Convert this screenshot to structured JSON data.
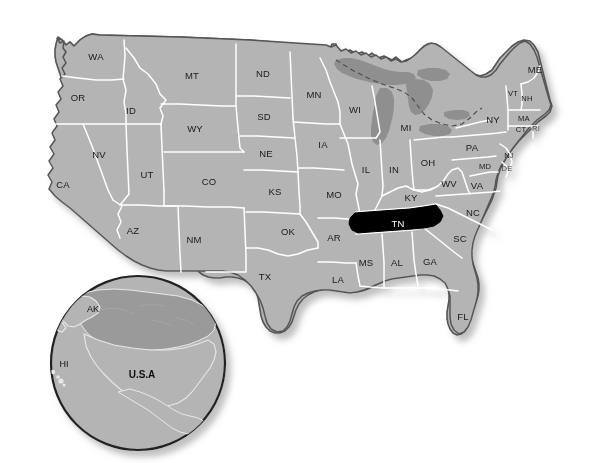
{
  "map": {
    "title": "United States map with Tennessee highlighted",
    "highlighted_state": "TN",
    "colors": {
      "state_fill": "#b4b4b4",
      "highlight_fill": "#000000",
      "highlight_label": "#ffffff",
      "state_border": "#ffffff",
      "outer_border": "#555555",
      "lake_fill": "#8f8f8f",
      "label": "#1a1a1a",
      "background": "#ffffff",
      "shadow": "#cfcfcf",
      "inset_land": "#b4b4b4",
      "inset_canada": "#9a9a9a",
      "inset_ring": "#222222"
    },
    "states": [
      {
        "code": "WA",
        "x": 96,
        "y": 57,
        "size": "normal"
      },
      {
        "code": "OR",
        "x": 78,
        "y": 98,
        "size": "normal"
      },
      {
        "code": "CA",
        "x": 63,
        "y": 185,
        "size": "normal"
      },
      {
        "code": "ID",
        "x": 131,
        "y": 111,
        "size": "normal"
      },
      {
        "code": "NV",
        "x": 99,
        "y": 155,
        "size": "normal"
      },
      {
        "code": "UT",
        "x": 147,
        "y": 175,
        "size": "normal"
      },
      {
        "code": "AZ",
        "x": 133,
        "y": 231,
        "size": "normal"
      },
      {
        "code": "MT",
        "x": 192,
        "y": 76,
        "size": "normal"
      },
      {
        "code": "WY",
        "x": 195,
        "y": 129,
        "size": "normal"
      },
      {
        "code": "CO",
        "x": 209,
        "y": 182,
        "size": "normal"
      },
      {
        "code": "NM",
        "x": 194,
        "y": 240,
        "size": "normal"
      },
      {
        "code": "ND",
        "x": 263,
        "y": 74,
        "size": "normal"
      },
      {
        "code": "SD",
        "x": 264,
        "y": 117,
        "size": "normal"
      },
      {
        "code": "NE",
        "x": 266,
        "y": 154,
        "size": "normal"
      },
      {
        "code": "KS",
        "x": 275,
        "y": 192,
        "size": "normal"
      },
      {
        "code": "OK",
        "x": 288,
        "y": 232,
        "size": "normal"
      },
      {
        "code": "TX",
        "x": 265,
        "y": 277,
        "size": "normal"
      },
      {
        "code": "MN",
        "x": 314,
        "y": 95,
        "size": "normal"
      },
      {
        "code": "IA",
        "x": 323,
        "y": 145,
        "size": "normal"
      },
      {
        "code": "MO",
        "x": 334,
        "y": 195,
        "size": "normal"
      },
      {
        "code": "AR",
        "x": 334,
        "y": 238,
        "size": "normal"
      },
      {
        "code": "LA",
        "x": 338,
        "y": 280,
        "size": "normal"
      },
      {
        "code": "WI",
        "x": 355,
        "y": 110,
        "size": "normal"
      },
      {
        "code": "IL",
        "x": 366,
        "y": 170,
        "size": "normal"
      },
      {
        "code": "MS",
        "x": 366,
        "y": 263,
        "size": "normal"
      },
      {
        "code": "MI",
        "x": 406,
        "y": 128,
        "size": "normal"
      },
      {
        "code": "IN",
        "x": 394,
        "y": 170,
        "size": "normal"
      },
      {
        "code": "KY",
        "x": 411,
        "y": 198,
        "size": "normal"
      },
      {
        "code": "TN",
        "x": 398,
        "y": 224,
        "size": "normal"
      },
      {
        "code": "AL",
        "x": 397,
        "y": 263,
        "size": "normal"
      },
      {
        "code": "OH",
        "x": 428,
        "y": 163,
        "size": "normal"
      },
      {
        "code": "WV",
        "x": 449,
        "y": 184,
        "size": "normal"
      },
      {
        "code": "GA",
        "x": 430,
        "y": 262,
        "size": "normal"
      },
      {
        "code": "FL",
        "x": 463,
        "y": 317,
        "size": "normal"
      },
      {
        "code": "SC",
        "x": 460,
        "y": 239,
        "size": "normal"
      },
      {
        "code": "NC",
        "x": 473,
        "y": 213,
        "size": "normal"
      },
      {
        "code": "VA",
        "x": 477,
        "y": 186,
        "size": "normal"
      },
      {
        "code": "PA",
        "x": 472,
        "y": 148,
        "size": "normal"
      },
      {
        "code": "NY",
        "x": 493,
        "y": 120,
        "size": "normal"
      },
      {
        "code": "ME",
        "x": 535,
        "y": 70,
        "size": "normal"
      },
      {
        "code": "VT",
        "x": 513,
        "y": 94,
        "size": "tiny"
      },
      {
        "code": "NH",
        "x": 527,
        "y": 99,
        "size": "tiny"
      },
      {
        "code": "MA",
        "x": 524,
        "y": 119,
        "size": "tiny"
      },
      {
        "code": "CT",
        "x": 521,
        "y": 130,
        "size": "tiny"
      },
      {
        "code": "RI",
        "x": 536,
        "y": 129,
        "size": "tiny"
      },
      {
        "code": "NJ",
        "x": 509,
        "y": 156,
        "size": "tiny"
      },
      {
        "code": "DE",
        "x": 507,
        "y": 169,
        "size": "tiny"
      },
      {
        "code": "MD",
        "x": 485,
        "y": 167,
        "size": "tiny"
      }
    ]
  },
  "inset": {
    "name": "north-america-globe-inset",
    "labels": [
      {
        "key": "AK",
        "text": "AK",
        "x": 93,
        "y": 310,
        "bold": false
      },
      {
        "key": "HI",
        "text": "HI",
        "x": 64,
        "y": 365,
        "bold": false
      },
      {
        "key": "USA",
        "text": "U.S.A",
        "x": 142,
        "y": 375,
        "bold": true
      }
    ]
  }
}
